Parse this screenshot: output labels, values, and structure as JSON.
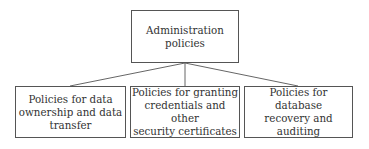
{
  "diagram": {
    "type": "hierarchy",
    "root": {
      "label": "Administration policies",
      "lines": [
        "Administration",
        "policies"
      ]
    },
    "children": [
      {
        "label": "Policies for data ownership and data transfer",
        "lines": [
          "Policies for data",
          "ownership and data",
          "transfer"
        ]
      },
      {
        "label": "Policies for granting credentials and other security certificates",
        "lines": [
          "Policies for granting",
          "credentials and other",
          "security certificates"
        ]
      },
      {
        "label": "Policies for database recovery and auditing",
        "lines": [
          "Policies for database",
          "recovery and auditing"
        ]
      }
    ],
    "colors": {
      "border": "#555555",
      "text": "#333333",
      "background": "#ffffff"
    }
  }
}
